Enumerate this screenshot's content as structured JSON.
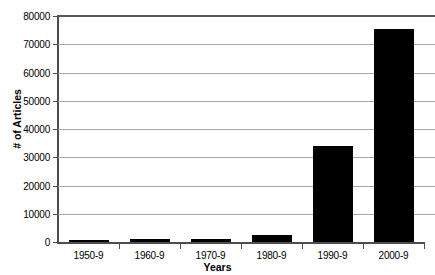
{
  "chart_data": {
    "type": "bar",
    "title": "",
    "xlabel": "Years",
    "ylabel": "# of Articles",
    "categories": [
      "1950-9",
      "1960-9",
      "1970-9",
      "1980-9",
      "1990-9",
      "2000-9"
    ],
    "values": [
      200,
      900,
      1200,
      2600,
      34000,
      75500
    ],
    "series": [
      {
        "name": "# of Articles",
        "values": [
          200,
          900,
          1200,
          2600,
          34000,
          75500
        ]
      }
    ],
    "ylim": [
      0,
      80000
    ],
    "ytick_values": [
      0,
      10000,
      20000,
      30000,
      40000,
      50000,
      60000,
      70000,
      80000
    ],
    "ytick_labels": [
      "0",
      "10000",
      "20000",
      "30000",
      "40000",
      "50000",
      "60000",
      "70000",
      "80000"
    ],
    "grid": "horizontal",
    "legend": "none",
    "bar_color": "#000000",
    "gridline_color": "#a8a8a8",
    "axis_color": "#4d4d4d",
    "background_color": "#ffffff"
  }
}
